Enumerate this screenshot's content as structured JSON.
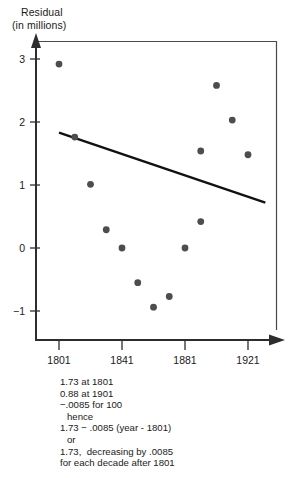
{
  "chart_data": {
    "type": "scatter",
    "title": "",
    "subtitle": "",
    "ylabel_line1": "Residual",
    "ylabel_line2": "(in millions)",
    "xlabel": "",
    "xlim": [
      1789,
      1937
    ],
    "ylim": [
      -1.55,
      3.35
    ],
    "grid": false,
    "legend": null,
    "xticks": [
      1801,
      1841,
      1881,
      1921
    ],
    "xticklabels": [
      "1801",
      "1841",
      "1881",
      "1921"
    ],
    "yticks": [
      3,
      2,
      1,
      0,
      -1
    ],
    "yticklabels": [
      "3",
      "2",
      "1",
      "0",
      "−1"
    ],
    "points": [
      {
        "x": 1801,
        "y": 2.92
      },
      {
        "x": 1811,
        "y": 1.76
      },
      {
        "x": 1821,
        "y": 1.01
      },
      {
        "x": 1831,
        "y": 0.29
      },
      {
        "x": 1841,
        "y": 0.0
      },
      {
        "x": 1851,
        "y": -0.55
      },
      {
        "x": 1861,
        "y": -0.94
      },
      {
        "x": 1871,
        "y": -0.77
      },
      {
        "x": 1881,
        "y": 0.0
      },
      {
        "x": 1891,
        "y": 0.42
      },
      {
        "x": 1891,
        "y": 1.54
      },
      {
        "x": 1901,
        "y": 2.58
      },
      {
        "x": 1911,
        "y": 2.03
      },
      {
        "x": 1921,
        "y": 1.48
      }
    ],
    "trendline": {
      "x0": 1801,
      "y0": 1.83,
      "x1": 1932,
      "y1": 0.72,
      "intercept_at_1801": 1.73,
      "value_at_1901": 0.88,
      "slope_per_year": -0.0085
    },
    "marker_color": "#4d4d4d",
    "line_color": "#111111",
    "axis_color": "#3a3a3a"
  },
  "caption": {
    "lines": [
      "1.73 at 1801",
      "0.88 at 1901",
      "−.0085 for 100",
      "hence",
      "1.73 − .0085 (year - 1801)",
      "or",
      "1.73,  decreasing by .0085",
      "for each decade after 1801"
    ],
    "indented": [
      false,
      false,
      false,
      true,
      false,
      true,
      false,
      false
    ]
  }
}
